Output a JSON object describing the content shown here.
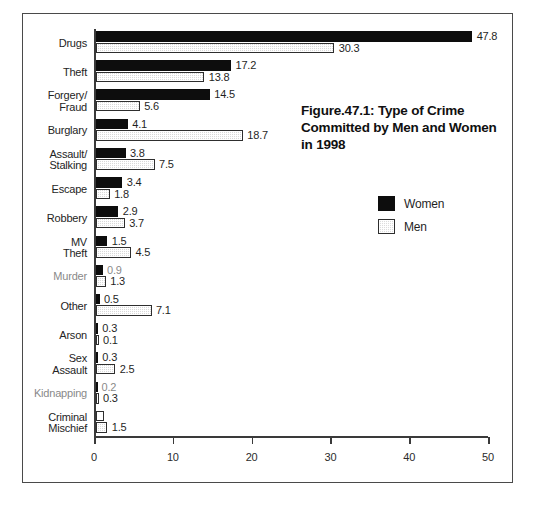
{
  "figure": {
    "title_lines": [
      "Figure.47.1: Type of Crime",
      "Committed by Men and Women",
      "in 1998"
    ]
  },
  "legend": {
    "position": "inside-right",
    "entries": [
      {
        "label": "Women",
        "swatch": "black-square-icon",
        "color": "#0d0d0d"
      },
      {
        "label": "Men",
        "swatch": "stippled-square-icon",
        "color": "#d9d9d9"
      }
    ]
  },
  "chart_data": {
    "type": "bar",
    "orientation": "horizontal",
    "xlabel": "",
    "ylabel": "",
    "xlim": [
      0,
      50
    ],
    "xticks": [
      0,
      10,
      20,
      30,
      40,
      50
    ],
    "xtick_labels": [
      "0",
      "10",
      "20",
      "30",
      "40",
      "50"
    ],
    "grid": false,
    "legend_position": "inside-right",
    "categories": [
      "Drugs",
      "Theft",
      "Forgery/\nFraud",
      "Burglary",
      "Assault/\nStalking",
      "Escape",
      "Robbery",
      "MV\nTheft",
      "Murder",
      "Other",
      "Arson",
      "Sex\nAssault",
      "Kidnapping",
      "Criminal\nMischief"
    ],
    "series": [
      {
        "name": "Women",
        "color": "#0d0d0d",
        "values": [
          47.8,
          17.2,
          14.5,
          4.1,
          3.8,
          3.4,
          2.9,
          1.5,
          0.9,
          0.5,
          0.3,
          0.3,
          0.2,
          null
        ],
        "labels": [
          "47.8",
          "17.2",
          "14.5",
          "4.1",
          "3.8",
          "3.4",
          "2.9",
          "1.5",
          "0.9",
          "0.5",
          "0.3",
          "0.3",
          "0.2",
          ""
        ]
      },
      {
        "name": "Men",
        "color": "#d9d9d9",
        "values": [
          30.3,
          13.8,
          5.6,
          18.7,
          7.5,
          1.8,
          3.7,
          4.5,
          1.3,
          7.1,
          0.1,
          2.5,
          0.3,
          1.5
        ],
        "labels": [
          "30.3",
          "13.8",
          "5.6",
          "18.7",
          "7.5",
          "1.8",
          "3.7",
          "4.5",
          "1.3",
          "7.1",
          "0.1",
          "2.5",
          "0.3",
          "1.5"
        ]
      }
    ]
  }
}
